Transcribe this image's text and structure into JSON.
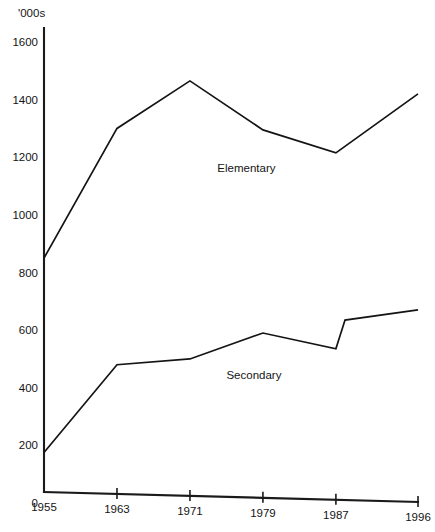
{
  "chart_data": {
    "type": "line",
    "title": "",
    "subtitle": "",
    "xlabel": "",
    "ylabel": "'000s",
    "x": [
      1955,
      1963,
      1971,
      1979,
      1987,
      1996
    ],
    "categories": [
      "1955",
      "1963",
      "1971",
      "1979",
      "1987",
      "1996"
    ],
    "xtick_labels": [
      "1955",
      "1963",
      "1971",
      "1979",
      "1987",
      "1996"
    ],
    "ytick_labels": [
      "0",
      "200",
      "400",
      "600",
      "800",
      "1000",
      "1200",
      "1400",
      "1600"
    ],
    "yticks": [
      0,
      200,
      400,
      600,
      800,
      1000,
      1200,
      1400,
      1600
    ],
    "xlim": [
      1955,
      1996
    ],
    "ylim": [
      0,
      1600
    ],
    "grid": false,
    "legend": "inline-annotations",
    "series": [
      {
        "name": "Elementary",
        "label": "Elementary",
        "label_position": {
          "x": 1974,
          "y": 1150
        },
        "values": [
          850,
          1300,
          1465,
          1295,
          1215,
          1420
        ]
      },
      {
        "name": "Secondary",
        "label": "Secondary",
        "label_position": {
          "x": 1975,
          "y": 430
        },
        "values": [
          175,
          480,
          500,
          590,
          535,
          670
        ],
        "extra_points": [
          {
            "x": 1988,
            "y": 635
          }
        ]
      }
    ],
    "annotations": [
      {
        "text": "Elementary",
        "x": 1974,
        "y": 1150
      },
      {
        "text": "Secondary",
        "x": 1975,
        "y": 430
      }
    ],
    "colors": {
      "line": "#141414",
      "axis": "#1a1a1a",
      "background": "#ffffff"
    }
  }
}
